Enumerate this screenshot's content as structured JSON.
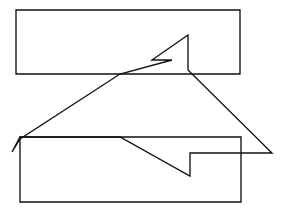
{
  "figure": {
    "title": "Overlapping rectangles and notched arrow polygon",
    "type": "line-drawing",
    "canvas": {
      "width": 285,
      "height": 213
    },
    "background_color": "#ffffff",
    "stroke_color": "#111111",
    "stroke_width": 1.35,
    "fill": "none",
    "shapes": [
      {
        "name": "upper-rectangle",
        "kind": "rectangle",
        "points": "16,10 240,10 240,74 16,74",
        "closed": true,
        "description": "Upper-left rectangle spanning the top portion of the canvas"
      },
      {
        "name": "lower-rectangle",
        "kind": "rectangle",
        "points": "20,137 241,137 241,202 20,202",
        "closed": true,
        "description": "Lower rectangle spanning the bottom portion of the canvas"
      },
      {
        "name": "notched-arrow-polygon",
        "kind": "polygon",
        "points": "12,152 20,137 120,137 190,176 190,153 272,153 188,70 188,35 152,60 172,60 120,74 20,139",
        "closed": true,
        "description": "Large arrow-like polygon with an upper notch and a lower notch overlapping both rectangles"
      }
    ]
  }
}
